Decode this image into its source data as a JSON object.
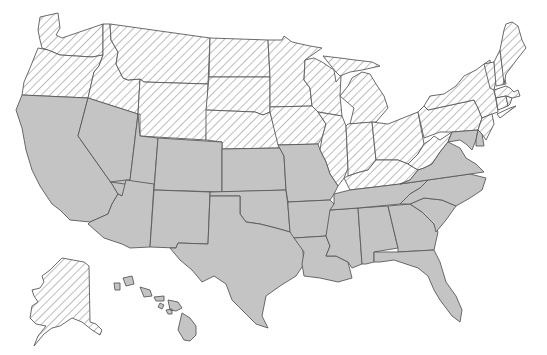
{
  "map": {
    "title": "",
    "description": "United States states map with two categories: diagonal hatched states and solid gray states",
    "legend": [],
    "categories": {
      "hatched": {
        "fill": "diagonal-hatch",
        "line_color": "#9a9a9a",
        "background": "#ffffff"
      },
      "gray": {
        "fill": "#c4c4c4"
      }
    },
    "border_color": "#5a5a5a",
    "states": [
      {
        "id": "WA",
        "name": "Washington",
        "category": "hatched"
      },
      {
        "id": "OR",
        "name": "Oregon",
        "category": "hatched"
      },
      {
        "id": "ID",
        "name": "Idaho",
        "category": "hatched"
      },
      {
        "id": "MT",
        "name": "Montana",
        "category": "hatched"
      },
      {
        "id": "WY",
        "name": "Wyoming",
        "category": "hatched"
      },
      {
        "id": "ND",
        "name": "North Dakota",
        "category": "hatched"
      },
      {
        "id": "SD",
        "name": "South Dakota",
        "category": "hatched"
      },
      {
        "id": "NE",
        "name": "Nebraska",
        "category": "hatched"
      },
      {
        "id": "MN",
        "name": "Minnesota",
        "category": "hatched"
      },
      {
        "id": "IA",
        "name": "Iowa",
        "category": "hatched"
      },
      {
        "id": "WI",
        "name": "Wisconsin",
        "category": "hatched"
      },
      {
        "id": "IL",
        "name": "Illinois",
        "category": "hatched"
      },
      {
        "id": "MI",
        "name": "Michigan",
        "category": "hatched"
      },
      {
        "id": "IN",
        "name": "Indiana",
        "category": "hatched"
      },
      {
        "id": "OH",
        "name": "Ohio",
        "category": "hatched"
      },
      {
        "id": "KY",
        "name": "Kentucky",
        "category": "hatched"
      },
      {
        "id": "WV",
        "name": "West Virginia",
        "category": "hatched"
      },
      {
        "id": "PA",
        "name": "Pennsylvania",
        "category": "hatched"
      },
      {
        "id": "NY",
        "name": "New York",
        "category": "hatched"
      },
      {
        "id": "NJ",
        "name": "New Jersey",
        "category": "hatched"
      },
      {
        "id": "VT",
        "name": "Vermont",
        "category": "hatched"
      },
      {
        "id": "NH",
        "name": "New Hampshire",
        "category": "hatched"
      },
      {
        "id": "ME",
        "name": "Maine",
        "category": "hatched"
      },
      {
        "id": "MA",
        "name": "Massachusetts",
        "category": "hatched"
      },
      {
        "id": "CT",
        "name": "Connecticut",
        "category": "hatched"
      },
      {
        "id": "RI",
        "name": "Rhode Island",
        "category": "hatched"
      },
      {
        "id": "AK",
        "name": "Alaska",
        "category": "hatched"
      },
      {
        "id": "CA",
        "name": "California",
        "category": "gray"
      },
      {
        "id": "NV",
        "name": "Nevada",
        "category": "gray"
      },
      {
        "id": "UT",
        "name": "Utah",
        "category": "gray"
      },
      {
        "id": "AZ",
        "name": "Arizona",
        "category": "gray"
      },
      {
        "id": "CO",
        "name": "Colorado",
        "category": "gray"
      },
      {
        "id": "NM",
        "name": "New Mexico",
        "category": "gray"
      },
      {
        "id": "KS",
        "name": "Kansas",
        "category": "gray"
      },
      {
        "id": "OK",
        "name": "Oklahoma",
        "category": "gray"
      },
      {
        "id": "TX",
        "name": "Texas",
        "category": "gray"
      },
      {
        "id": "MO",
        "name": "Missouri",
        "category": "gray"
      },
      {
        "id": "AR",
        "name": "Arkansas",
        "category": "gray"
      },
      {
        "id": "LA",
        "name": "Louisiana",
        "category": "gray"
      },
      {
        "id": "MS",
        "name": "Mississippi",
        "category": "gray"
      },
      {
        "id": "AL",
        "name": "Alabama",
        "category": "gray"
      },
      {
        "id": "TN",
        "name": "Tennessee",
        "category": "gray"
      },
      {
        "id": "GA",
        "name": "Georgia",
        "category": "gray"
      },
      {
        "id": "FL",
        "name": "Florida",
        "category": "gray"
      },
      {
        "id": "SC",
        "name": "South Carolina",
        "category": "gray"
      },
      {
        "id": "NC",
        "name": "North Carolina",
        "category": "gray"
      },
      {
        "id": "VA",
        "name": "Virginia",
        "category": "gray"
      },
      {
        "id": "MD",
        "name": "Maryland",
        "category": "gray"
      },
      {
        "id": "DE",
        "name": "Delaware",
        "category": "gray"
      },
      {
        "id": "HI",
        "name": "Hawaii",
        "category": "gray"
      }
    ]
  }
}
